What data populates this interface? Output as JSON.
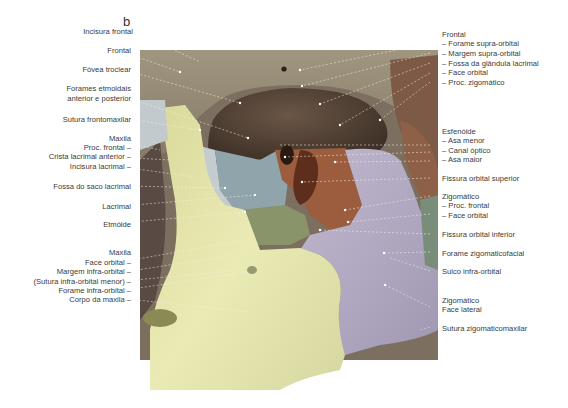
{
  "figure": {
    "letter": "b",
    "colors": {
      "frontal": "#8f8570",
      "orbit_dark": "#4b3b30",
      "sphenoid": "#9a5a3c",
      "ethmoid": "#8aa0a8",
      "lacrimal": "#8a9468",
      "maxilla": "#e3e3a8",
      "zygomatic": "#b5acc4",
      "zygo_edge": "#7b8c78"
    }
  },
  "labels_left": [
    {
      "text": "Incisura frontal"
    },
    {
      "text": "Frontal"
    },
    {
      "text": "Fóvea troclear"
    },
    {
      "text": "Forames etmoidais"
    },
    {
      "text": "anterior e posterior"
    },
    {
      "text": "Sutura frontomaxilar"
    },
    {
      "text": "Maxila"
    },
    {
      "text": "Proc. frontal –"
    },
    {
      "text": "Crista lacrimal anterior –"
    },
    {
      "text": "Incisura lacrimal –"
    },
    {
      "text": "Fossa do saco lacrimal"
    },
    {
      "text": "Lacrimal"
    },
    {
      "text": "Etmóide"
    },
    {
      "text": "Maxila"
    },
    {
      "text": "Face orbital –"
    },
    {
      "text": "Margem infra-orbital –"
    },
    {
      "text": "(Sutura infra-orbital menor) –"
    },
    {
      "text": "Forame infra-orbital –"
    },
    {
      "text": "Corpo da maxila –"
    }
  ],
  "labels_right": [
    {
      "text": "Frontal"
    },
    {
      "text": "– Forame supra-orbital"
    },
    {
      "text": "– Margem supra-orbital"
    },
    {
      "text": "– Fossa da glândula lacrimal"
    },
    {
      "text": "– Face orbital"
    },
    {
      "text": "– Proc. zigomático"
    },
    {
      "text": "Esfenóide"
    },
    {
      "text": "– Asa menor"
    },
    {
      "text": "– Canal óptico"
    },
    {
      "text": "– Asa maior"
    },
    {
      "text": "Fissura orbital superior"
    },
    {
      "text": "Zigomático"
    },
    {
      "text": "– Proc. frontal"
    },
    {
      "text": "– Face orbital"
    },
    {
      "text": "Fissura orbital inferior"
    },
    {
      "text": "Forame zigomaticofacial"
    },
    {
      "text": "Sulco infra-orbital"
    },
    {
      "text": "Zigomático"
    },
    {
      "text": "Face lateral"
    },
    {
      "text": "Sutura zigomaticomaxilar"
    }
  ]
}
